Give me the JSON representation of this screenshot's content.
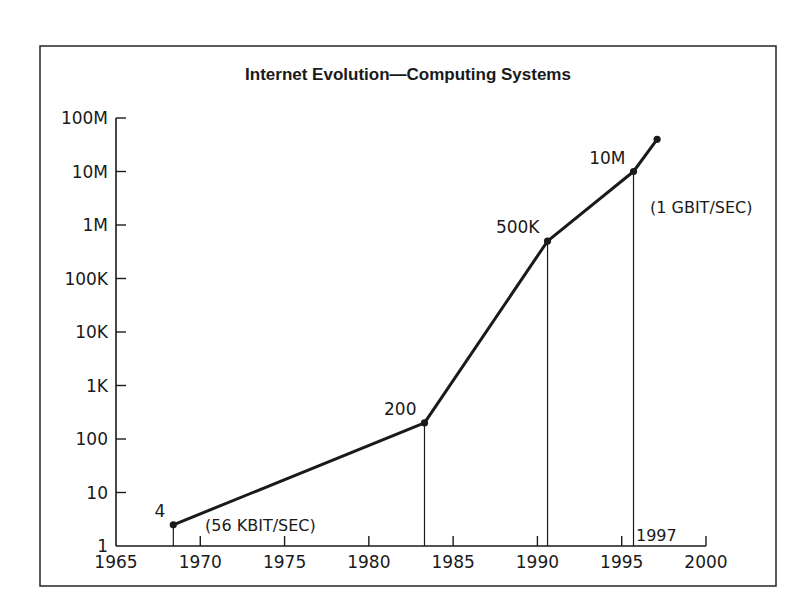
{
  "chart_data": {
    "type": "line",
    "title": "Internet Evolution—Computing Systems",
    "xlabel": "",
    "ylabel": "",
    "x_scale": "linear",
    "y_scale": "log",
    "xlim": [
      1965,
      2000
    ],
    "ylim": [
      1,
      100000000
    ],
    "x_ticks": [
      1965,
      1970,
      1975,
      1980,
      1985,
      1990,
      1995,
      2000
    ],
    "x_tick_labels": [
      "1965",
      "1970",
      "1975",
      "1980",
      "1985",
      "1990",
      "1995",
      "2000"
    ],
    "y_ticks": [
      1,
      10,
      100,
      1000,
      10000,
      100000,
      1000000,
      10000000,
      100000000
    ],
    "y_tick_labels": [
      "1",
      "10",
      "100",
      "1K",
      "10K",
      "100K",
      "1M",
      "10M",
      "100M"
    ],
    "grid": false,
    "legend": null,
    "series": [
      {
        "name": "Computing systems on the Internet",
        "points": [
          {
            "x": 1968.4,
            "y": 4,
            "label": "4",
            "drop_line": true
          },
          {
            "x": 1983.3,
            "y": 200,
            "label": "200",
            "drop_line": true
          },
          {
            "x": 1990.6,
            "y": 500000,
            "label": "500K",
            "drop_line": true
          },
          {
            "x": 1995.7,
            "y": 10000000,
            "label": "10M",
            "drop_line": true
          },
          {
            "x": 1997.1,
            "y": 40000000,
            "label": "",
            "drop_line": false
          }
        ]
      }
    ],
    "annotations": [
      {
        "text": "(56 KBIT/SEC)",
        "near_x": 1970,
        "note": "speed at start"
      },
      {
        "text": "(1 GBIT/SEC)",
        "near_x": 1997,
        "note": "speed at end"
      },
      {
        "text": "1997",
        "near_x": 1995.7,
        "note": "label next to drop line"
      }
    ]
  },
  "layout": {
    "frame": {
      "x": 40,
      "y": 46,
      "w": 736,
      "h": 540
    },
    "plot": {
      "x0": 116,
      "x1": 706,
      "y_bottom": 546,
      "y_top": 118
    },
    "colors": {
      "ink": "#1a1a1a",
      "frame": "#333333",
      "background": "#ffffff"
    }
  }
}
